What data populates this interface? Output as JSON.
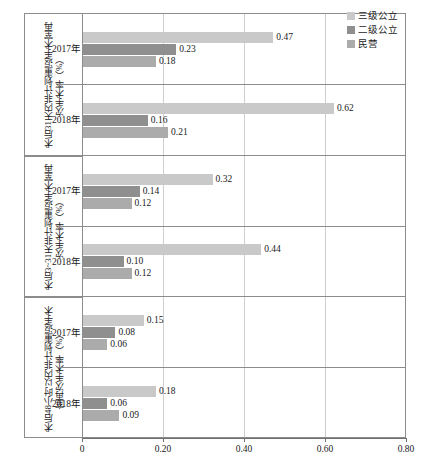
{
  "chart_data": {
    "type": "bar",
    "orientation": "horizontal",
    "title": "",
    "subtitle": "",
    "xlabel": "",
    "ylabel": "",
    "xlim": [
      0,
      0.8
    ],
    "xticks": [
      0,
      0.2,
      0.4,
      0.6,
      0.8
    ],
    "xtick_labels": [
      "0",
      "0.20",
      "0.40",
      "0.60",
      "0.80"
    ],
    "grid": true,
    "grid_axis": "x",
    "legend_position": "top-right",
    "legend": [
      "三级公立",
      "二级公立",
      "民营"
    ],
    "series": [
      {
        "name": "三级公立",
        "color": "#c9c9c9",
        "values": [
          0.47,
          0.62,
          0.32,
          0.44,
          0.15,
          0.18
        ]
      },
      {
        "name": "二级公立",
        "color": "#8f8f8f",
        "values": [
          0.23,
          0.16,
          0.14,
          0.1,
          0.08,
          0.06
        ]
      },
      {
        "name": "民营",
        "color": "#ababab",
        "values": [
          0.18,
          0.21,
          0.12,
          0.12,
          0.06,
          0.09
        ]
      }
    ],
    "groups": [
      {
        "label": "术后31天内非计划重返手术室再次手术率（%）",
        "years": [
          {
            "year": "2017年",
            "bars": [
              {
                "series": "三级公立",
                "value": 0.47,
                "label": "0.47"
              },
              {
                "series": "二级公立",
                "value": 0.23,
                "label": "0.23"
              },
              {
                "series": "民营",
                "value": 0.18,
                "label": "0.18"
              }
            ]
          },
          {
            "year": "2018年",
            "bars": [
              {
                "series": "三级公立",
                "value": 0.62,
                "label": "0.62"
              },
              {
                "series": "二级公立",
                "value": 0.16,
                "label": "0.16"
              },
              {
                "series": "民营",
                "value": 0.21,
                "label": "0.21"
              }
            ]
          }
        ]
      },
      {
        "label": "术后3~31天非计划重返手术室再次手术率（%）",
        "years": [
          {
            "year": "2017年",
            "bars": [
              {
                "series": "三级公立",
                "value": 0.32,
                "label": "0.32"
              },
              {
                "series": "二级公立",
                "value": 0.14,
                "label": "0.14"
              },
              {
                "series": "民营",
                "value": 0.12,
                "label": "0.12"
              }
            ]
          },
          {
            "year": "2018年",
            "bars": [
              {
                "series": "三级公立",
                "value": 0.44,
                "label": "0.44"
              },
              {
                "series": "二级公立",
                "value": 0.1,
                "label": "0.10"
              },
              {
                "series": "民营",
                "value": 0.12,
                "label": "0.12"
              }
            ]
          }
        ]
      },
      {
        "label": "术后48小时以内非计划重返手术室再次手术率（%）",
        "years": [
          {
            "year": "2017年",
            "bars": [
              {
                "series": "三级公立",
                "value": 0.15,
                "label": "0.15"
              },
              {
                "series": "二级公立",
                "value": 0.08,
                "label": "0.08"
              },
              {
                "series": "民营",
                "value": 0.06,
                "label": "0.06"
              }
            ]
          },
          {
            "year": "2018年",
            "bars": [
              {
                "series": "三级公立",
                "value": 0.18,
                "label": "0.18"
              },
              {
                "series": "二级公立",
                "value": 0.06,
                "label": "0.06"
              },
              {
                "series": "民营",
                "value": 0.09,
                "label": "0.09"
              }
            ]
          }
        ]
      }
    ]
  }
}
